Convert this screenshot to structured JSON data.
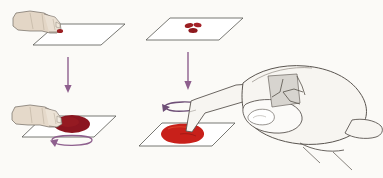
{
  "figure": {
    "title": "Blood smear preparation — four step illustration",
    "background_color": "#fbfaf7",
    "panel_count": 4
  },
  "palette": {
    "background": "#fbfaf7",
    "slide_outline": "#4a4a4a",
    "slide_fill": "#ffffff",
    "skin_fill_small": "#e3d6c6",
    "skin_fill_large": "#f7f5f1",
    "skin_outline": "#5a5550",
    "blood_dark": "#8b1520",
    "blood_bright": "#c8201a",
    "blood_drop_small": "#9b1f22",
    "arrow_purple": "#8e5f8e",
    "shadow_gray": "#c9c6c0"
  },
  "panels": [
    {
      "id": "panel-top-left",
      "name": "finger-with-blood-drop-over-slide",
      "label": "Step 1",
      "description": "A finger holding a small drop of blood positioned above an empty glass slide",
      "elements": {
        "slide": {
          "name": "glass-slide",
          "shape": "parallelogram"
        },
        "hand": {
          "name": "finger-hand-small",
          "fill": "#e3d6c6"
        },
        "blood": {
          "name": "blood-drop-fingertip",
          "color": "#9b1f22",
          "size": "small"
        }
      }
    },
    {
      "id": "panel-top-right",
      "name": "slide-with-blood-drops",
      "label": "Step 2",
      "description": "Glass slide with a small cluster of blood drops deposited on its surface",
      "elements": {
        "slide": {
          "name": "glass-slide",
          "shape": "parallelogram"
        },
        "blood": {
          "name": "blood-drop-cluster",
          "color": "#9b1f22",
          "drop_count": 3
        }
      }
    },
    {
      "id": "panel-bottom-left",
      "name": "finger-spreading-blood",
      "label": "Step 3",
      "description": "Finger pressing and spreading the blood into a dark oval pool on the slide, circular motion arrow beneath",
      "elements": {
        "slide": {
          "name": "glass-slide",
          "shape": "parallelogram"
        },
        "hand": {
          "name": "finger-hand-small",
          "fill": "#e3d6c6"
        },
        "blood": {
          "name": "blood-pool-dark",
          "color": "#8b1520",
          "size": "large-oval"
        },
        "arrow": {
          "name": "circular-rotation-arrow",
          "color": "#8e5f8e",
          "direction": "counter-clockwise"
        }
      }
    },
    {
      "id": "panel-bottom-right",
      "name": "fingertip-rotating-on-blood-pool",
      "label": "Step 4",
      "description": "Extended index finger of a large hand rotating on a bright red blood pool on the slide, circular motion arrow around the fingertip",
      "elements": {
        "slide": {
          "name": "glass-slide",
          "shape": "parallelogram"
        },
        "hand": {
          "name": "detailed-hand-large",
          "fill": "#f7f5f1"
        },
        "blood": {
          "name": "blood-pool-bright",
          "color": "#c8201a",
          "size": "large-oval"
        },
        "arrow": {
          "name": "circular-rotation-arrow",
          "color": "#8e5f8e",
          "direction": "counter-clockwise"
        }
      }
    }
  ],
  "connectors": [
    {
      "id": "arrow-left",
      "name": "down-arrow-left",
      "from_panel": "panel-top-left",
      "to_panel": "panel-bottom-left",
      "color": "#8e5f8e",
      "direction": "down"
    },
    {
      "id": "arrow-right",
      "name": "down-arrow-right",
      "from_panel": "panel-top-right",
      "to_panel": "panel-bottom-right",
      "color": "#8e5f8e",
      "direction": "down"
    }
  ]
}
